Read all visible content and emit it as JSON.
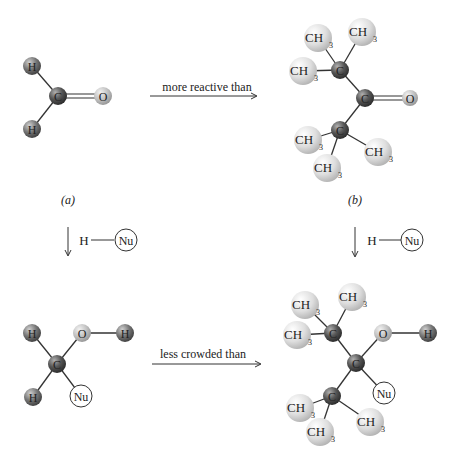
{
  "colors": {
    "carbon": "#5a5a5a",
    "hydrogen": "#6e6e6e",
    "oxygen": "#c4c4c4",
    "methyl": "#dcdcdc",
    "bond": "#333333",
    "text": "#222222"
  },
  "top": {
    "arrow_label": "more reactive than",
    "caption_a": "(a)",
    "caption_b": "(b)"
  },
  "reagent": {
    "h": "H",
    "nu": "Nu"
  },
  "bottom": {
    "arrow_label": "less crowded than"
  },
  "atoms": {
    "H": "H",
    "C": "C",
    "O": "O",
    "CH": "CH",
    "sub3": "3",
    "Nu": "Nu"
  }
}
